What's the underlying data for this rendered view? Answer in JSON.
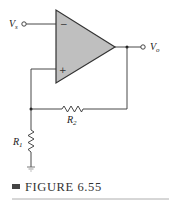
{
  "figure": {
    "caption": "FIGURE 6.55",
    "colors": {
      "wire": "#333333",
      "opamp_fill": "#bfbfbf",
      "caption_bullet": "#444444",
      "divider": "#9a9a9a"
    }
  },
  "labels": {
    "input": {
      "main": "V",
      "sub": "s"
    },
    "output": {
      "main": "V",
      "sub": "o"
    },
    "r1": {
      "main": "R",
      "sub": "1"
    },
    "r2": {
      "main": "R",
      "sub": "2"
    },
    "inverting": "−",
    "noninverting": "+"
  }
}
